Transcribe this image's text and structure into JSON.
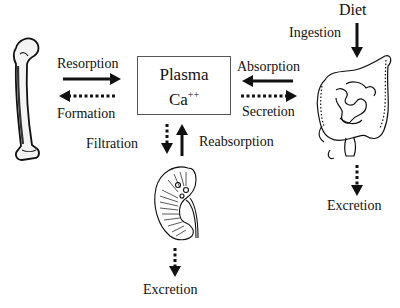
{
  "diagram": {
    "center": {
      "line1": "Plasma",
      "line2": "Ca",
      "superscript": "++"
    },
    "bone": {
      "icon": "bone-femur-icon",
      "to_plasma_label": "Resorption",
      "from_plasma_label": "Formation"
    },
    "gut": {
      "icon": "intestine-icon",
      "source_label": "Diet",
      "intake_label": "Ingestion",
      "to_plasma_label": "Absorption",
      "from_plasma_label": "Secretion",
      "output_label": "Excretion"
    },
    "kidney": {
      "icon": "kidney-icon",
      "from_plasma_label": "Filtration",
      "to_plasma_label": "Reabsorption",
      "output_label": "Excretion"
    },
    "legend": {
      "solid_arrow": "flow into plasma / intake",
      "dotted_arrow": "flow out of plasma / loss"
    },
    "colors": {
      "ink": "#111111",
      "box_border": "#555555",
      "background": "#ffffff"
    }
  }
}
